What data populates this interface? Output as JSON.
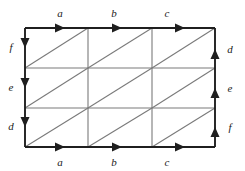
{
  "figure": {
    "name": "triangulated-rectangle-edge-identification-diagram",
    "colors": {
      "background": "#ffffff",
      "boundary": "#1f1f1f",
      "interior_grid": "#7a7a7a",
      "diagonal": "#7a7a7a",
      "label": "#1a1a1a"
    },
    "geometry": {
      "left": 25,
      "right": 215,
      "top": 28,
      "bottom": 147,
      "vertical_gridlines": [
        88,
        152
      ],
      "horizontal_gridlines": [
        68,
        108
      ],
      "columns": 3,
      "rows": 3,
      "diagonal_direction": "bottom-left-to-top-right"
    }
  },
  "edges": {
    "top": [
      {
        "label": "a",
        "x": 60,
        "y": 17,
        "arrow_x": 60,
        "arrow_dir": "right"
      },
      {
        "label": "b",
        "x": 114,
        "y": 17,
        "arrow_x": 117,
        "arrow_dir": "right"
      },
      {
        "label": "c",
        "x": 167,
        "y": 17,
        "arrow_x": 180,
        "arrow_dir": "right"
      }
    ],
    "bottom": [
      {
        "label": "a",
        "x": 60,
        "y": 166,
        "arrow_x": 60,
        "arrow_dir": "right"
      },
      {
        "label": "b",
        "x": 114,
        "y": 166,
        "arrow_x": 117,
        "arrow_dir": "right"
      },
      {
        "label": "c",
        "x": 167,
        "y": 166,
        "arrow_x": 180,
        "arrow_dir": "right"
      }
    ],
    "left": [
      {
        "label": "f",
        "x": 11,
        "y": 51,
        "arrow_y": 46,
        "arrow_dir": "down"
      },
      {
        "label": "e",
        "x": 11,
        "y": 91,
        "arrow_y": 86,
        "arrow_dir": "down"
      },
      {
        "label": "d",
        "x": 11,
        "y": 130,
        "arrow_y": 126,
        "arrow_dir": "down"
      }
    ],
    "right": [
      {
        "label": "d",
        "x": 228,
        "y": 53,
        "arrow_y": 50,
        "arrow_dir": "up"
      },
      {
        "label": "e",
        "x": 228,
        "y": 92,
        "arrow_y": 89,
        "arrow_dir": "up"
      },
      {
        "label": "f",
        "x": 228,
        "y": 131,
        "arrow_y": 128,
        "arrow_dir": "up"
      }
    ]
  }
}
